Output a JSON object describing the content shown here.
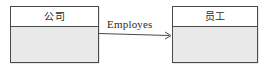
{
  "diagram": {
    "type": "class-association-diagram",
    "background_color": "#ffffff",
    "entities": [
      {
        "id": "company",
        "title": "公司",
        "header_fill": "#ffffff",
        "body_fill": "#e9e9e9",
        "border_color": "#4a4a4a"
      },
      {
        "id": "employee",
        "title": "员工",
        "header_fill": "#ffffff",
        "body_fill": "#e9e9e9",
        "border_color": "#4a4a4a"
      }
    ],
    "association": {
      "label": "Employes",
      "from": "company",
      "to": "employee",
      "direction": "left-to-right",
      "arrowhead": "open",
      "line_color": "#4a4a4a"
    }
  }
}
